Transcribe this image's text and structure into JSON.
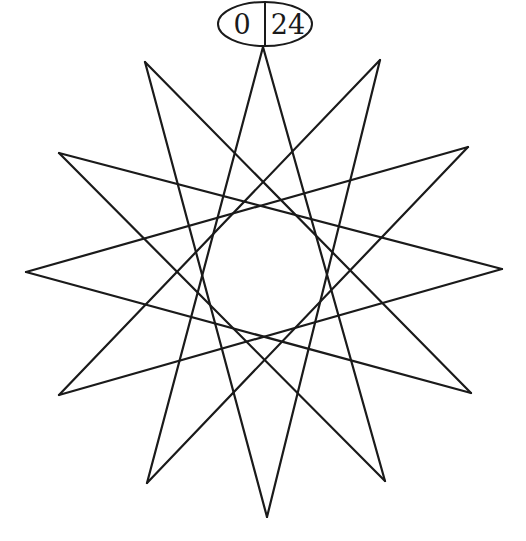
{
  "diagram": {
    "type": "star-polygon-graph",
    "notation": "{12/5}",
    "stroke_color": "#1a1a1a",
    "background": "#ffffff",
    "root_node": {
      "left_label": "0",
      "right_label": "24",
      "cx": 265,
      "cy": 24,
      "rx": 47,
      "ry": 22
    },
    "vertices": [
      {
        "id": 0,
        "x": 263,
        "y": 47
      },
      {
        "id": 1,
        "x": 380,
        "y": 60
      },
      {
        "id": 2,
        "x": 468,
        "y": 147
      },
      {
        "id": 3,
        "x": 502,
        "y": 269
      },
      {
        "id": 4,
        "x": 471,
        "y": 393
      },
      {
        "id": 5,
        "x": 385,
        "y": 481
      },
      {
        "id": 6,
        "x": 267,
        "y": 517
      },
      {
        "id": 7,
        "x": 147,
        "y": 483
      },
      {
        "id": 8,
        "x": 59,
        "y": 395
      },
      {
        "id": 9,
        "x": 26,
        "y": 272
      },
      {
        "id": 10,
        "x": 59,
        "y": 153
      },
      {
        "id": 11,
        "x": 145,
        "y": 62
      }
    ],
    "step": 5
  }
}
